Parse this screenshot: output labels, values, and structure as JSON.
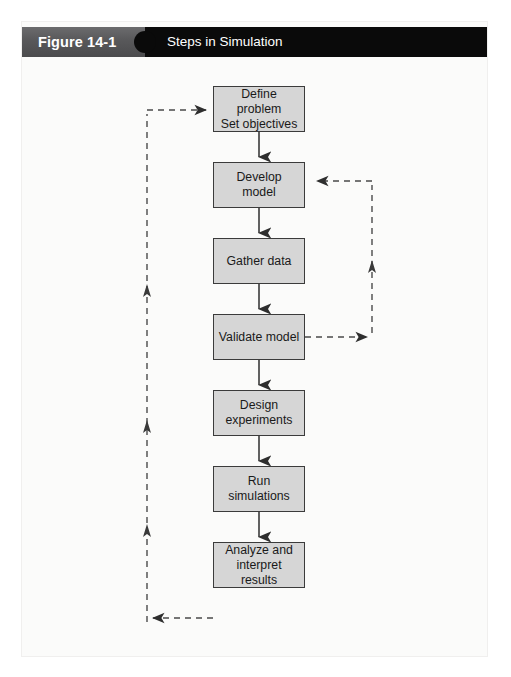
{
  "figure": {
    "caption_number": "Figure 14-1",
    "caption_title": "Steps in Simulation",
    "caption_band_color": "#58585a",
    "caption_bar_color": "#0a0a0a",
    "page_background": "#fbfbfa",
    "node_fill_color": "#d6d6d6",
    "node_border_color": "#3b3b3b",
    "connector_color": "#2e2e2e"
  },
  "flowchart": {
    "type": "flowchart",
    "orientation": "vertical",
    "nodes": [
      {
        "id": "n1",
        "label": "Define problem\nSet objectives",
        "x": 191,
        "y": 64,
        "w": 92,
        "h": 46
      },
      {
        "id": "n2",
        "label": "Develop model",
        "x": 191,
        "y": 140,
        "w": 92,
        "h": 46
      },
      {
        "id": "n3",
        "label": "Gather data",
        "x": 191,
        "y": 216,
        "w": 92,
        "h": 46
      },
      {
        "id": "n4",
        "label": "Validate model",
        "x": 191,
        "y": 292,
        "w": 92,
        "h": 46
      },
      {
        "id": "n5",
        "label": "Design\nexperiments",
        "x": 191,
        "y": 368,
        "w": 92,
        "h": 46
      },
      {
        "id": "n6",
        "label": "Run simulations",
        "x": 191,
        "y": 444,
        "w": 92,
        "h": 46
      },
      {
        "id": "n7",
        "label": "Analyze and\ninterpret results",
        "x": 191,
        "y": 520,
        "w": 92,
        "h": 46
      }
    ],
    "forward_edges": [
      {
        "from": "n1",
        "to": "n2",
        "style": "solid"
      },
      {
        "from": "n2",
        "to": "n3",
        "style": "solid"
      },
      {
        "from": "n3",
        "to": "n4",
        "style": "solid"
      },
      {
        "from": "n4",
        "to": "n5",
        "style": "solid"
      },
      {
        "from": "n5",
        "to": "n6",
        "style": "solid"
      },
      {
        "from": "n6",
        "to": "n7",
        "style": "solid"
      }
    ],
    "feedback_edges": [
      {
        "from": "n7",
        "to": "n1",
        "style": "dashed",
        "side": "left",
        "description": "Analyze and interpret results feeds back to Define problem / Set objectives"
      },
      {
        "from": "n4",
        "to": "n2",
        "style": "dashed",
        "side": "right",
        "description": "Validate model feeds back to Develop model"
      }
    ]
  }
}
